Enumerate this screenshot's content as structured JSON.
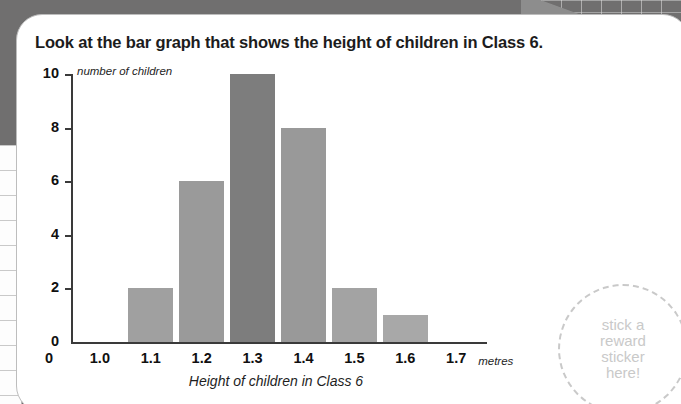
{
  "card": {
    "title": "Look at the bar graph that shows the height of children in Class 6."
  },
  "sticker": {
    "text": "stick a\nreward\nsticker\nhere!",
    "color": "#c9c9c9"
  },
  "chart_data": {
    "type": "bar",
    "title": "",
    "xlabel": "Height of children in Class 6",
    "ylabel": "number of children",
    "x_unit_label": "metres",
    "categories": [
      "1.0",
      "1.1",
      "1.2",
      "1.3",
      "1.4",
      "1.5",
      "1.6",
      "1.7"
    ],
    "xtick_labels": [
      "0",
      "1.0",
      "1.1",
      "1.2",
      "1.3",
      "1.4",
      "1.5",
      "1.6",
      "1.7"
    ],
    "ytick_labels": [
      "0",
      "2",
      "4",
      "6",
      "8",
      "10"
    ],
    "ylim": [
      0,
      10
    ],
    "grid": false,
    "legend": "none",
    "bars": [
      {
        "category": "1.1",
        "value": 2,
        "color": "#a0a0a0"
      },
      {
        "category": "1.2",
        "value": 6,
        "color": "#9a9a9a"
      },
      {
        "category": "1.3",
        "value": 10,
        "color": "#7d7d7d"
      },
      {
        "category": "1.4",
        "value": 8,
        "color": "#999999"
      },
      {
        "category": "1.5",
        "value": 2,
        "color": "#a3a3a3"
      },
      {
        "category": "1.6",
        "value": 1,
        "color": "#a8a8a8"
      }
    ],
    "values": [
      0,
      2,
      6,
      10,
      8,
      2,
      1,
      0
    ]
  }
}
